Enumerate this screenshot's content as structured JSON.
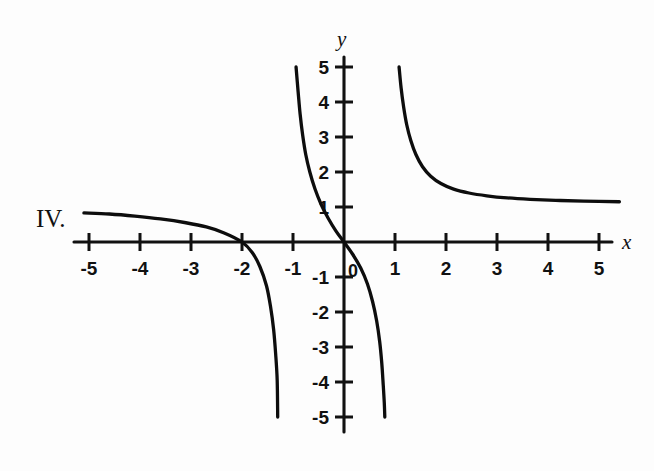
{
  "figure": {
    "label": "IV.",
    "background_color": "#fdfdfd",
    "ink_color": "#111111"
  },
  "axes": {
    "x_axis_name": "x",
    "y_axis_name": "y",
    "origin_label": "0",
    "x_tick_labels": [
      "-5",
      "-4",
      "-3",
      "-2",
      "-1",
      "1",
      "2",
      "3",
      "4",
      "5"
    ],
    "y_tick_labels": [
      "5",
      "4",
      "3",
      "2",
      "1",
      "-1",
      "-2",
      "-3",
      "-4",
      "-5"
    ]
  },
  "chart_data": {
    "type": "line",
    "title": "",
    "xlabel": "x",
    "ylabel": "y",
    "xlim": [
      -5.6,
      5.7
    ],
    "ylim": [
      -5.4,
      5.4
    ],
    "grid": false,
    "legend": "none",
    "x_ticks": [
      -5,
      -4,
      -3,
      -2,
      -1,
      1,
      2,
      3,
      4,
      5
    ],
    "y_ticks": [
      5,
      4,
      3,
      2,
      1,
      -1,
      -2,
      -3,
      -4,
      -5
    ],
    "annotations": [
      "IV.",
      "0"
    ],
    "series": [
      {
        "name": "left-branch",
        "comment": "Quadrant II to III branch, crosses x-axis at x = -2, falls steeply toward vertical asymptote near x = -1.2",
        "points": [
          [
            -5.1,
            0.83
          ],
          [
            -4.6,
            0.8
          ],
          [
            -4.1,
            0.74
          ],
          [
            -3.6,
            0.66
          ],
          [
            -3.1,
            0.55
          ],
          [
            -2.7,
            0.43
          ],
          [
            -2.35,
            0.26
          ],
          [
            -2.0,
            0.0
          ],
          [
            -1.8,
            -0.3
          ],
          [
            -1.65,
            -0.7
          ],
          [
            -1.52,
            -1.25
          ],
          [
            -1.44,
            -1.85
          ],
          [
            -1.38,
            -2.5
          ],
          [
            -1.34,
            -3.2
          ],
          [
            -1.31,
            -3.95
          ],
          [
            -1.3,
            -5.0
          ]
        ]
      },
      {
        "name": "center-branch",
        "comment": "Steep decreasing branch through the origin, from (-0.94, 5) down to (0.80, -5)",
        "points": [
          [
            -0.94,
            5.0
          ],
          [
            -0.9,
            4.3
          ],
          [
            -0.86,
            3.65
          ],
          [
            -0.81,
            3.05
          ],
          [
            -0.75,
            2.5
          ],
          [
            -0.67,
            2.0
          ],
          [
            -0.57,
            1.52
          ],
          [
            -0.45,
            1.08
          ],
          [
            -0.31,
            0.68
          ],
          [
            -0.16,
            0.32
          ],
          [
            0.0,
            0.0
          ],
          [
            0.17,
            -0.35
          ],
          [
            0.33,
            -0.75
          ],
          [
            0.46,
            -1.2
          ],
          [
            0.56,
            -1.7
          ],
          [
            0.64,
            -2.25
          ],
          [
            0.7,
            -2.85
          ],
          [
            0.74,
            -3.45
          ],
          [
            0.77,
            -4.1
          ],
          [
            0.79,
            -4.6
          ],
          [
            0.8,
            -5.0
          ]
        ]
      },
      {
        "name": "right-branch",
        "comment": "Quadrant I decreasing branch from (1.08, 5) flattening toward horizontal asymptote y = 1.15",
        "points": [
          [
            1.08,
            5.0
          ],
          [
            1.12,
            4.4
          ],
          [
            1.17,
            3.85
          ],
          [
            1.23,
            3.35
          ],
          [
            1.31,
            2.9
          ],
          [
            1.41,
            2.5
          ],
          [
            1.54,
            2.15
          ],
          [
            1.7,
            1.88
          ],
          [
            1.9,
            1.67
          ],
          [
            2.15,
            1.51
          ],
          [
            2.45,
            1.4
          ],
          [
            2.8,
            1.32
          ],
          [
            3.2,
            1.26
          ],
          [
            3.65,
            1.22
          ],
          [
            4.15,
            1.19
          ],
          [
            4.7,
            1.17
          ],
          [
            5.4,
            1.15
          ]
        ]
      }
    ]
  }
}
